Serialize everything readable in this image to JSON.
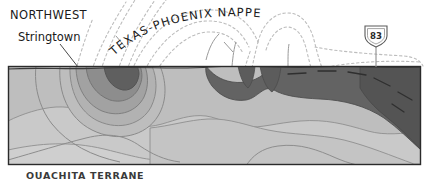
{
  "figure": {
    "kind": "geologic-cross-section",
    "labels": {
      "northwest": "NORTHWEST",
      "stringtown": "Stringtown",
      "nappe": "TEXAS-PHOENIX NAPPE",
      "bottom_caption": "OUACHITA TERRANE"
    },
    "highway_shield": {
      "route_number": "83",
      "type": "us-highway-shield"
    },
    "colors": {
      "unit_light": "#c8c8c8",
      "unit_medium": "#b4b4b4",
      "unit_mid_dark": "#9a9a9a",
      "unit_dark": "#6e6e6e",
      "unit_darkest": "#4f4f4f",
      "outline": "#2b2b2b",
      "internal_line": "#7b7b7b",
      "dashed_line": "#b8b8b8",
      "text": "#1a1a1a",
      "background": "#ffffff"
    },
    "box": {
      "x": 8,
      "y": 66,
      "width": 413,
      "height": 99
    },
    "leader_lines": [
      {
        "name": "stringtown-leader",
        "x1": 60,
        "y1": 44,
        "x2": 78,
        "y2": 67
      },
      {
        "name": "shield-leader",
        "x1": 376,
        "y1": 48,
        "x2": 376,
        "y2": 67
      },
      {
        "name": "nappe-leader",
        "x1": 222,
        "y1": 44,
        "x2": 206,
        "y2": 56
      }
    ]
  }
}
